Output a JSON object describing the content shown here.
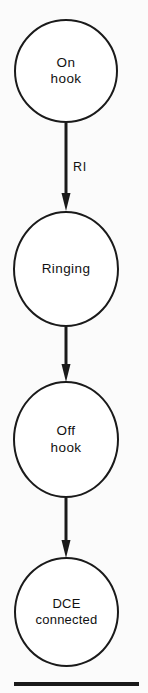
{
  "diagram": {
    "type": "state-transition-diagram",
    "orientation": "vertical",
    "background_color": "#fbfbfb",
    "stroke_color": "#1a1a1a",
    "fill_color": "#ffffff",
    "states": [
      {
        "id": "on-hook",
        "label": "On\nhook",
        "order": 1
      },
      {
        "id": "ringing",
        "label": "Ringing",
        "order": 2
      },
      {
        "id": "off-hook",
        "label": "Off\nhook",
        "order": 3
      },
      {
        "id": "dce-connected",
        "label": "DCE\nconnected",
        "order": 4
      }
    ],
    "transitions": [
      {
        "id": "t1",
        "from": "on-hook",
        "to": "ringing",
        "label": "RI"
      },
      {
        "id": "t2",
        "from": "ringing",
        "to": "off-hook",
        "label": ""
      },
      {
        "id": "t3",
        "from": "off-hook",
        "to": "dce-connected",
        "label": ""
      }
    ],
    "rule": {
      "id": "bottom-rule",
      "visible": true
    }
  }
}
